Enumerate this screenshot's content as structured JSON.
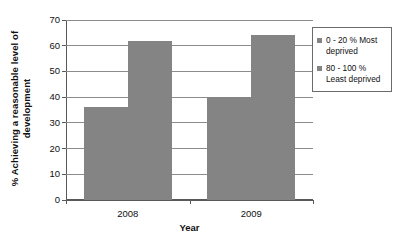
{
  "chart_data": {
    "type": "bar",
    "title": "",
    "categories": [
      "2008",
      "2009"
    ],
    "series": [
      {
        "name": "0 - 20 % Most deprived",
        "values": [
          36,
          40
        ],
        "color": "#848484"
      },
      {
        "name": "80 - 100 % Least deprived",
        "values": [
          62,
          64
        ],
        "color": "#848484"
      }
    ],
    "xlabel": "Year",
    "ylabel": "% Achieving a reasonable level of development",
    "ylim": [
      0,
      70
    ],
    "ytick_labels": [
      "70",
      "60",
      "50",
      "40",
      "30",
      "20",
      "10",
      "0"
    ],
    "ytick_values": [
      70,
      60,
      50,
      40,
      30,
      20,
      10,
      0
    ],
    "grid": true,
    "legend_position": "right"
  },
  "legend": {
    "items": [
      {
        "label": "0 - 20 % Most deprived"
      },
      {
        "label": "80 - 100 % Least deprived"
      }
    ]
  },
  "axes": {
    "x_title": "Year",
    "y_title": "% Achieving a reasonable level of development"
  }
}
